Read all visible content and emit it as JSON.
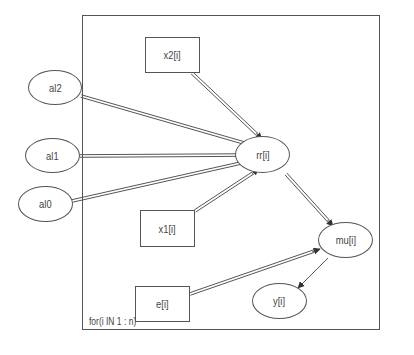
{
  "plate": {
    "label": "for(i IN 1 : n)",
    "x": 82,
    "y": 15,
    "w": 298,
    "h": 315
  },
  "nodes": [
    {
      "id": "x2",
      "label": "x2[i]",
      "shape": "rect",
      "x": 145,
      "y": 37,
      "w": 55,
      "h": 36
    },
    {
      "id": "al2",
      "label": "al2",
      "shape": "ellipse",
      "x": 28,
      "y": 70,
      "w": 54,
      "h": 35
    },
    {
      "id": "al1",
      "label": "al1",
      "shape": "ellipse",
      "x": 25,
      "y": 138,
      "w": 55,
      "h": 35
    },
    {
      "id": "al0",
      "label": "al0",
      "shape": "ellipse",
      "x": 18,
      "y": 186,
      "w": 55,
      "h": 36
    },
    {
      "id": "rr",
      "label": "rr[i]",
      "shape": "ellipse",
      "x": 235,
      "y": 136,
      "w": 55,
      "h": 37
    },
    {
      "id": "x1",
      "label": "x1[i]",
      "shape": "rect",
      "x": 140,
      "y": 210,
      "w": 55,
      "h": 37
    },
    {
      "id": "mu",
      "label": "mu[i]",
      "shape": "ellipse",
      "x": 318,
      "y": 222,
      "w": 55,
      "h": 36
    },
    {
      "id": "e",
      "label": "e[i]",
      "shape": "rect",
      "x": 135,
      "y": 286,
      "w": 55,
      "h": 36
    },
    {
      "id": "y",
      "label": "y[i]",
      "shape": "ellipse",
      "x": 252,
      "y": 283,
      "w": 55,
      "h": 36
    }
  ],
  "edges": [
    {
      "from": "x2",
      "to": "rr",
      "style": "double",
      "x1": 192,
      "y1": 73,
      "x2": 262,
      "y2": 139
    },
    {
      "from": "al2",
      "to": "rr",
      "style": "double",
      "x1": 81,
      "y1": 96,
      "x2": 251,
      "y2": 145
    },
    {
      "from": "al1",
      "to": "rr",
      "style": "double",
      "x1": 80,
      "y1": 156,
      "x2": 250,
      "y2": 155
    },
    {
      "from": "al0",
      "to": "rr",
      "style": "double",
      "x1": 72,
      "y1": 201,
      "x2": 250,
      "y2": 161
    },
    {
      "from": "x1",
      "to": "rr",
      "style": "double",
      "x1": 195,
      "y1": 211,
      "x2": 259,
      "y2": 169
    },
    {
      "from": "rr",
      "to": "mu",
      "style": "double",
      "x1": 286,
      "y1": 174,
      "x2": 333,
      "y2": 226
    },
    {
      "from": "e",
      "to": "mu",
      "style": "double",
      "x1": 190,
      "y1": 294,
      "x2": 320,
      "y2": 249
    },
    {
      "from": "mu",
      "to": "y",
      "style": "single",
      "x1": 328,
      "y1": 258,
      "x2": 298,
      "y2": 288
    }
  ],
  "colors": {
    "stroke": "#555555",
    "text": "#444444",
    "background": "#ffffff"
  }
}
